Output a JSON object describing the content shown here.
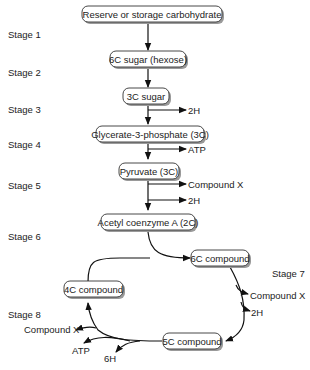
{
  "diagram": {
    "boxes": {
      "reserve": "Reserve or storage carbohydrate",
      "hexose": "6C sugar (hexose)",
      "sugar3c": "3C sugar",
      "glycerate": "Glycerate-3-phosphate (3C)",
      "pyruvate": "Pyruvate (3C)",
      "acetyl": "Acetyl coenzyme A (2C)",
      "c6": "6C compound",
      "c4": "4C compound",
      "c5": "5C compound"
    },
    "stages": [
      "Stage 1",
      "Stage 2",
      "Stage 3",
      "Stage 4",
      "Stage 5",
      "Stage 6",
      "Stage 7",
      "Stage 8"
    ],
    "products": {
      "s3_2h": "2H",
      "s4_atp": "ATP",
      "s5_x": "Compound X",
      "s5_2h": "2H",
      "s7_x": "Compound X",
      "s7_2h": "2H",
      "s8_x": "Compound X",
      "s8_atp": "ATP",
      "s8_6h": "6H"
    }
  }
}
